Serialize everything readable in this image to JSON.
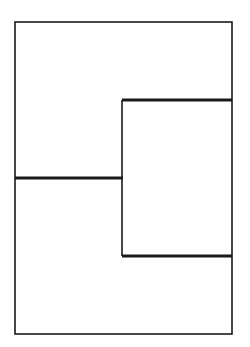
{
  "figure": {
    "canvas": {
      "width": 250,
      "height": 347,
      "background_color": "#ffffff"
    },
    "style": {
      "line_color": "#1a1a1a",
      "thin_width": 1.6,
      "thick_width": 3.2
    },
    "outer_rectangle": {
      "name": "outer-rectangle",
      "x": 15,
      "y": 22,
      "width": 217,
      "height": 312,
      "stroke_width": 1.6
    },
    "segments": [
      {
        "name": "upper-thick-horizontal",
        "orientation": "horizontal",
        "x1": 122,
        "y1": 100,
        "x2": 232,
        "y2": 100,
        "stroke_width": 3.2
      },
      {
        "name": "middle-thick-horizontal",
        "orientation": "horizontal",
        "x1": 15,
        "y1": 178,
        "x2": 123,
        "y2": 178,
        "stroke_width": 3.2
      },
      {
        "name": "lower-thick-horizontal",
        "orientation": "horizontal",
        "x1": 122,
        "y1": 256,
        "x2": 232,
        "y2": 256,
        "stroke_width": 3.2
      },
      {
        "name": "inner-thin-vertical",
        "orientation": "vertical",
        "x1": 122,
        "y1": 100,
        "x2": 122,
        "y2": 256,
        "stroke_width": 1.6
      }
    ]
  }
}
